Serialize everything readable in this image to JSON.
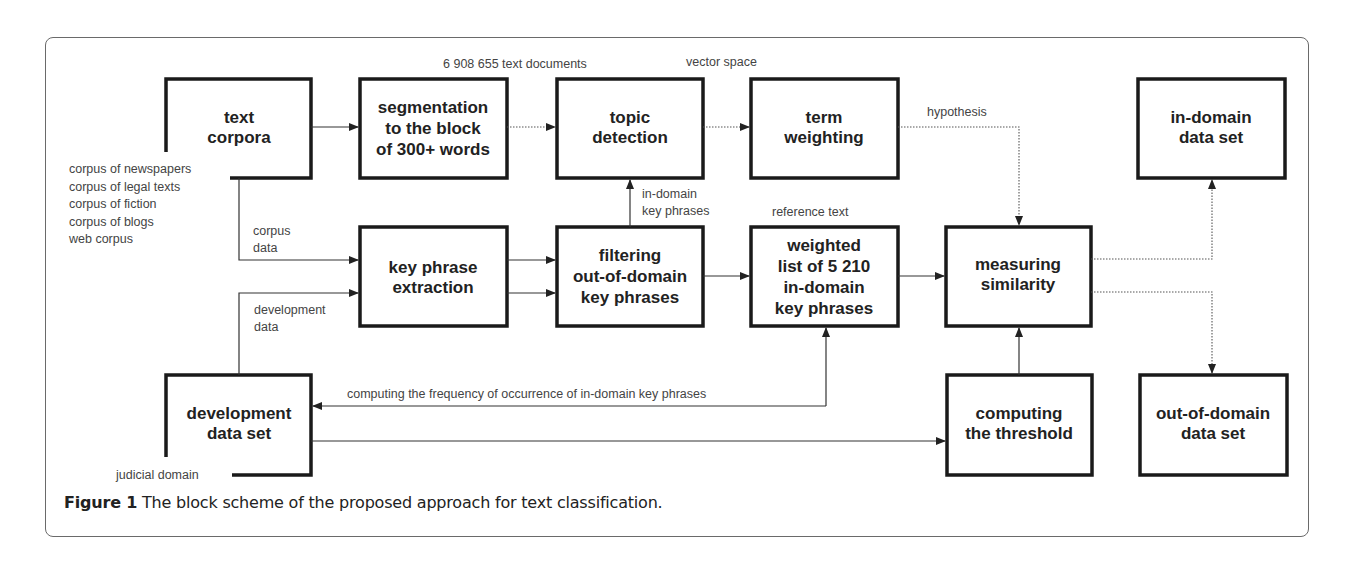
{
  "figure": {
    "caption_label": "Figure 1",
    "caption_text": " The block scheme of the proposed approach for text classification."
  },
  "blocks": {
    "text_corpora": [
      "text",
      "corpora"
    ],
    "segmentation": [
      "segmentation",
      "to the block",
      "of 300+ words"
    ],
    "topic_detection": [
      "topic",
      "detection"
    ],
    "term_weighting": [
      "term",
      "weighting"
    ],
    "in_domain": [
      "in-domain",
      "data set"
    ],
    "key_phrase": [
      "key phrase",
      "extraction"
    ],
    "filtering": [
      "filtering",
      "out-of-domain",
      "key phrases"
    ],
    "weighted_list": [
      "weighted",
      "list of 5 210",
      "in-domain",
      "key phrases"
    ],
    "measuring": [
      "measuring",
      "similarity"
    ],
    "development": [
      "development",
      "data set"
    ],
    "threshold": [
      "computing",
      "the threshold"
    ],
    "out_of_domain": [
      "out-of-domain",
      "data set"
    ]
  },
  "notes": {
    "documents": "6 908 655 text documents",
    "vector_space": "vector space",
    "hypothesis": "hypothesis",
    "in_domain_kp": [
      "in-domain",
      "key phrases"
    ],
    "reference_text": "reference text",
    "corpora_list": [
      "corpus of newspapers",
      "corpus of legal texts",
      "corpus of fiction",
      "corpus of blogs",
      "web corpus"
    ],
    "corpus_data": [
      "corpus",
      "data"
    ],
    "development_data": [
      "development",
      "data"
    ],
    "frequency": "computing the frequency of occurrence of in-domain key phrases",
    "judicial_domain": "judicial domain"
  }
}
